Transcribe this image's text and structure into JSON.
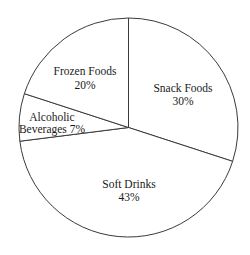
{
  "chart_data": {
    "type": "pie",
    "title": "",
    "start_angle_deg": 0,
    "direction": "clockwise",
    "categories": [
      "Snack Foods",
      "Soft Drinks",
      "Alcoholic Beverages",
      "Frozen Foods"
    ],
    "values": [
      30,
      43,
      7,
      20
    ],
    "unit": "%",
    "legend": "none",
    "slices": [
      {
        "name": "Snack Foods",
        "value": 30,
        "line1": "Snack Foods",
        "line2": "30%"
      },
      {
        "name": "Soft Drinks",
        "value": 43,
        "line1": "Soft Drinks",
        "line2": "43%"
      },
      {
        "name": "Alcoholic Beverages",
        "value": 7,
        "line1": "Alcoholic",
        "line2": "Beverages 7%"
      },
      {
        "name": "Frozen Foods",
        "value": 20,
        "line1": "Frozen Foods",
        "line2": "20%"
      }
    ]
  },
  "colors": {
    "fill": "#ffffff",
    "stroke": "#3a3a3a",
    "text": "#1a1a1a"
  }
}
